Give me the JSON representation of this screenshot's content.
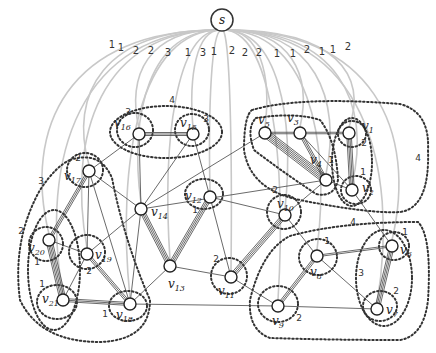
{
  "diagram": {
    "source": {
      "label": "s",
      "x": 222,
      "y": 20
    },
    "arc_weights": [
      {
        "label": "1",
        "x": 112,
        "y": 48
      },
      {
        "label": "1",
        "x": 121,
        "y": 51
      },
      {
        "label": "2",
        "x": 136,
        "y": 54
      },
      {
        "label": "2",
        "x": 151,
        "y": 54
      },
      {
        "label": "3",
        "x": 168,
        "y": 56
      },
      {
        "label": "1",
        "x": 188,
        "y": 56
      },
      {
        "label": "3",
        "x": 203,
        "y": 56
      },
      {
        "label": "1",
        "x": 214,
        "y": 55
      },
      {
        "label": "2",
        "x": 232,
        "y": 54
      },
      {
        "label": "2",
        "x": 245,
        "y": 56
      },
      {
        "label": "2",
        "x": 259,
        "y": 56
      },
      {
        "label": "1",
        "x": 277,
        "y": 57
      },
      {
        "label": "1",
        "x": 293,
        "y": 57
      },
      {
        "label": "2",
        "x": 307,
        "y": 53
      },
      {
        "label": "1",
        "x": 322,
        "y": 55
      },
      {
        "label": "1",
        "x": 333,
        "y": 53
      },
      {
        "label": "2",
        "x": 348,
        "y": 50
      }
    ],
    "nodes": [
      {
        "id": "v1",
        "label": "v",
        "sub": "1",
        "x": 349,
        "y": 133,
        "lx": 362,
        "ly": 130
      },
      {
        "id": "v2",
        "label": "v",
        "sub": "2",
        "x": 352,
        "y": 190,
        "lx": 362,
        "ly": 192
      },
      {
        "id": "v3",
        "label": "v",
        "sub": "3",
        "x": 300,
        "y": 133,
        "lx": 287,
        "ly": 122
      },
      {
        "id": "v4",
        "label": "v",
        "sub": "4",
        "x": 326,
        "y": 180,
        "lx": 310,
        "ly": 164
      },
      {
        "id": "v5",
        "label": "v",
        "sub": "5",
        "x": 265,
        "y": 133,
        "lx": 258,
        "ly": 124
      },
      {
        "id": "v6",
        "label": "v",
        "sub": "6",
        "x": 392,
        "y": 246,
        "lx": 400,
        "ly": 254
      },
      {
        "id": "v7",
        "label": "v",
        "sub": "7",
        "x": 377,
        "y": 309,
        "lx": 386,
        "ly": 314
      },
      {
        "id": "v8",
        "label": "v",
        "sub": "8",
        "x": 317,
        "y": 256,
        "lx": 310,
        "ly": 276
      },
      {
        "id": "v9",
        "label": "v",
        "sub": "9",
        "x": 278,
        "y": 306,
        "lx": 272,
        "ly": 325
      },
      {
        "id": "v10",
        "label": "v",
        "sub": "10",
        "x": 285,
        "y": 215,
        "lx": 277,
        "ly": 208
      },
      {
        "id": "v11",
        "label": "v",
        "sub": "11",
        "x": 231,
        "y": 277,
        "lx": 218,
        "ly": 295
      },
      {
        "id": "v12",
        "label": "v",
        "sub": "12",
        "x": 210,
        "y": 197,
        "lx": 185,
        "ly": 200
      },
      {
        "id": "v13",
        "label": "v",
        "sub": "13",
        "x": 170,
        "y": 266,
        "lx": 168,
        "ly": 288
      },
      {
        "id": "v14",
        "label": "v",
        "sub": "14",
        "x": 141,
        "y": 209,
        "lx": 151,
        "ly": 216
      },
      {
        "id": "v15",
        "label": "v",
        "sub": "15",
        "x": 193,
        "y": 134,
        "lx": 180,
        "ly": 127
      },
      {
        "id": "v16",
        "label": "v",
        "sub": "16",
        "x": 139,
        "y": 134,
        "lx": 114,
        "ly": 127
      },
      {
        "id": "v17",
        "label": "v",
        "sub": "17",
        "x": 89,
        "y": 171,
        "lx": 64,
        "ly": 180
      },
      {
        "id": "v18",
        "label": "v",
        "sub": "18",
        "x": 130,
        "y": 304,
        "lx": 116,
        "ly": 319
      },
      {
        "id": "v19",
        "label": "v",
        "sub": "19",
        "x": 87,
        "y": 254,
        "lx": 95,
        "ly": 259
      },
      {
        "id": "v20",
        "label": "v",
        "sub": "20",
        "x": 49,
        "y": 240,
        "lx": 28,
        "ly": 252
      },
      {
        "id": "v21",
        "label": "v",
        "sub": "21",
        "x": 63,
        "y": 300,
        "lx": 42,
        "ly": 303
      }
    ],
    "edges": [
      {
        "from": "v5",
        "to": "v3",
        "mult": 2
      },
      {
        "from": "v3",
        "to": "v1",
        "mult": 2
      },
      {
        "from": "v1",
        "to": "v2",
        "mult": 4
      },
      {
        "from": "v5",
        "to": "v4",
        "mult": 6
      },
      {
        "from": "v3",
        "to": "v4",
        "mult": 3
      },
      {
        "from": "v3",
        "to": "v2",
        "mult": 1
      },
      {
        "from": "v4",
        "to": "v2",
        "mult": 1
      },
      {
        "from": "v16",
        "to": "v15",
        "mult": 3
      },
      {
        "from": "v17",
        "to": "v16",
        "mult": 1
      },
      {
        "from": "v16",
        "to": "v14",
        "mult": 1
      },
      {
        "from": "v15",
        "to": "v14",
        "mult": 1
      },
      {
        "from": "v15",
        "to": "v12",
        "mult": 1
      },
      {
        "from": "v14",
        "to": "v5",
        "mult": 1
      },
      {
        "from": "v17",
        "to": "v14",
        "mult": 1
      },
      {
        "from": "v17",
        "to": "v20",
        "mult": 3
      },
      {
        "from": "v17",
        "to": "v19",
        "mult": 1
      },
      {
        "from": "v17",
        "to": "v18",
        "mult": 1
      },
      {
        "from": "v20",
        "to": "v21",
        "mult": 5
      },
      {
        "from": "v20",
        "to": "v19",
        "mult": 1
      },
      {
        "from": "v19",
        "to": "v21",
        "mult": 1
      },
      {
        "from": "v19",
        "to": "v18",
        "mult": 3
      },
      {
        "from": "v21",
        "to": "v18",
        "mult": 3
      },
      {
        "from": "v14",
        "to": "v19",
        "mult": 1
      },
      {
        "from": "v14",
        "to": "v13",
        "mult": 4
      },
      {
        "from": "v13",
        "to": "v12",
        "mult": 4
      },
      {
        "from": "v14",
        "to": "v18",
        "mult": 1
      },
      {
        "from": "v13",
        "to": "v18",
        "mult": 1
      },
      {
        "from": "v12",
        "to": "v10",
        "mult": 1
      },
      {
        "from": "v12",
        "to": "v11",
        "mult": 1
      },
      {
        "from": "v13",
        "to": "v11",
        "mult": 1
      },
      {
        "from": "v10",
        "to": "v11",
        "mult": 4
      },
      {
        "from": "v10",
        "to": "v4",
        "mult": 1
      },
      {
        "from": "v14",
        "to": "v4",
        "mult": 1
      },
      {
        "from": "v11",
        "to": "v9",
        "mult": 1
      },
      {
        "from": "v18",
        "to": "v9",
        "mult": 1
      },
      {
        "from": "v9",
        "to": "v8",
        "mult": 3
      },
      {
        "from": "v8",
        "to": "v6",
        "mult": 2
      },
      {
        "from": "v8",
        "to": "v7",
        "mult": 1
      },
      {
        "from": "v9",
        "to": "v7",
        "mult": 1
      },
      {
        "from": "v6",
        "to": "v7",
        "mult": 4
      },
      {
        "from": "v10",
        "to": "v8",
        "mult": 1
      },
      {
        "from": "v2",
        "to": "v6",
        "mult": 1
      }
    ],
    "region_weights": [
      {
        "label": "4",
        "x": 172,
        "y": 103
      },
      {
        "label": "3",
        "x": 128,
        "y": 115
      },
      {
        "label": "3",
        "x": 206,
        "y": 122
      },
      {
        "label": "2",
        "x": 364,
        "y": 146
      },
      {
        "label": "1",
        "x": 331,
        "y": 163
      },
      {
        "label": "4",
        "x": 418,
        "y": 161
      },
      {
        "label": "1",
        "x": 363,
        "y": 175
      },
      {
        "label": "2",
        "x": 78,
        "y": 161
      },
      {
        "label": "3",
        "x": 41,
        "y": 184
      },
      {
        "label": "2",
        "x": 21,
        "y": 234
      },
      {
        "label": "1",
        "x": 37,
        "y": 265
      },
      {
        "label": "2",
        "x": 89,
        "y": 274
      },
      {
        "label": "1",
        "x": 42,
        "y": 287
      },
      {
        "label": "1",
        "x": 105,
        "y": 317
      },
      {
        "label": "1",
        "x": 195,
        "y": 213
      },
      {
        "label": "2",
        "x": 275,
        "y": 193
      },
      {
        "label": "2",
        "x": 216,
        "y": 262
      },
      {
        "label": "4",
        "x": 353,
        "y": 225
      },
      {
        "label": "1",
        "x": 327,
        "y": 244
      },
      {
        "label": "1",
        "x": 405,
        "y": 235
      },
      {
        "label": "3",
        "x": 361,
        "y": 276
      },
      {
        "label": "2",
        "x": 396,
        "y": 294
      },
      {
        "label": "2",
        "x": 299,
        "y": 321
      }
    ]
  }
}
